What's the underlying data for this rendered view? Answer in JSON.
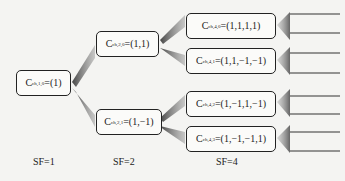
{
  "diagram": {
    "type": "OVSF code tree",
    "nodes": [
      {
        "id": "c-ch-1-0",
        "letter": "C",
        "sub": "ch,1,0",
        "value": "=(1)"
      },
      {
        "id": "c-ch-2-0",
        "letter": "C",
        "sub": "ch,2,0",
        "value": "=(1,1)"
      },
      {
        "id": "c-ch-2-1",
        "letter": "C",
        "sub": "ch,2,1",
        "value": "=(1,−1)"
      },
      {
        "id": "c-ch-4-0",
        "letter": "C",
        "sub": "ch,4,0",
        "value": "=(1,1,1,1)"
      },
      {
        "id": "c-ch-4-1",
        "letter": "C",
        "sub": "ch,4,1",
        "value": "=(1,1,−1,−1)"
      },
      {
        "id": "c-ch-4-2",
        "letter": "C",
        "sub": "ch,4,2",
        "value": "=(1,−1,1,−1)"
      },
      {
        "id": "c-ch-4-3",
        "letter": "C",
        "sub": "ch,4,3",
        "value": "=(1,−1,−1,1)"
      }
    ],
    "edges": [
      [
        "c-ch-1-0",
        "c-ch-2-0"
      ],
      [
        "c-ch-1-0",
        "c-ch-2-1"
      ],
      [
        "c-ch-2-0",
        "c-ch-4-0"
      ],
      [
        "c-ch-2-0",
        "c-ch-4-1"
      ],
      [
        "c-ch-2-1",
        "c-ch-4-2"
      ],
      [
        "c-ch-2-1",
        "c-ch-4-3"
      ]
    ],
    "sf_labels": [
      "SF=1",
      "SF=2",
      "SF=4"
    ]
  }
}
